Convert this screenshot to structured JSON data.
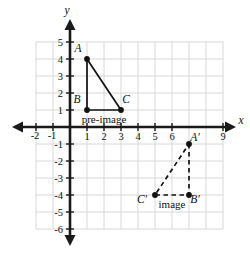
{
  "chart_data": {
    "type": "scatter",
    "title": "",
    "xlabel": "x",
    "ylabel": "y",
    "xlim": [
      -2,
      9
    ],
    "ylim": [
      -6,
      5
    ],
    "grid": true,
    "legend": "none",
    "x_ticks": [
      -2,
      -1,
      1,
      2,
      3,
      4,
      5,
      6,
      9
    ],
    "x_tick_labels": [
      "-2",
      "-1",
      "1",
      "2",
      "3",
      "4",
      "5",
      "6",
      "9"
    ],
    "y_ticks": [
      5,
      4,
      3,
      2,
      1,
      -1,
      -2,
      -3,
      -4,
      -5,
      -6
    ],
    "y_tick_labels": [
      "5",
      "4",
      "3",
      "2",
      "1",
      "-1",
      "-2",
      "-3",
      "-4",
      "-5",
      "-6"
    ],
    "series": [
      {
        "name": "pre-image",
        "style": "solid",
        "caption": "pre-image",
        "caption_point": [
          2,
          1
        ],
        "points": [
          {
            "label": "A",
            "x": 1,
            "y": 4,
            "label_dx": -9,
            "label_dy": -7
          },
          {
            "label": "B",
            "x": 1,
            "y": 1,
            "label_dx": -10,
            "label_dy": -7
          },
          {
            "label": "C",
            "x": 3,
            "y": 1,
            "label_dx": 5,
            "label_dy": -7
          }
        ],
        "closed": true
      },
      {
        "name": "image",
        "style": "dashed",
        "caption": "image",
        "caption_point": [
          6,
          -4
        ],
        "points": [
          {
            "label": "A′",
            "x": 7,
            "y": -1,
            "label_dx": 6,
            "label_dy": -3
          },
          {
            "label": "B′",
            "x": 7,
            "y": -4,
            "label_dx": 6,
            "label_dy": 8
          },
          {
            "label": "C′",
            "x": 5,
            "y": -4,
            "label_dx": -13,
            "label_dy": 8
          }
        ],
        "closed": true
      }
    ]
  },
  "colors": {
    "grid": "#d8d8d8",
    "axis": "#1a1a1a",
    "ink": "#111111",
    "background": "#ffffff"
  },
  "geometry": {
    "origin_x": 70,
    "origin_y": 127,
    "unit": 17.0,
    "grid_x_min": -2,
    "grid_x_max": 9,
    "grid_y_min": -6,
    "grid_y_max": 5,
    "arrow_left_x": 12,
    "arrow_right_x": 236,
    "arrow_top_y": 19,
    "arrow_bottom_y": 246,
    "x_axis_label_pos": [
      241,
      124
    ],
    "y_axis_label_pos": [
      67,
      14
    ]
  }
}
